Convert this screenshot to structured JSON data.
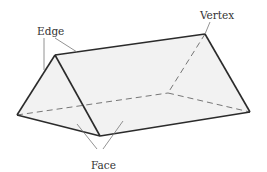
{
  "diagram": {
    "labels": {
      "edge": "Edge",
      "vertex": "Vertex",
      "face": "Face"
    },
    "colors": {
      "face_fill": "#f2f2f2",
      "edge_stroke": "#2b2b2b",
      "hidden_edge_stroke": "#777777",
      "leader_line": "#777777",
      "label_text": "#333333"
    }
  }
}
